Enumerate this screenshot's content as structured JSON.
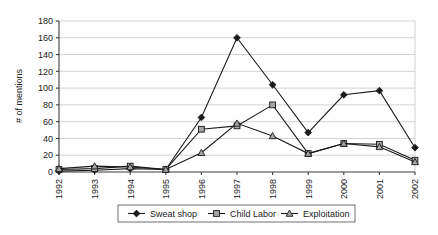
{
  "chart_data": {
    "type": "line",
    "title": "",
    "xlabel": "",
    "ylabel": "# of mentions",
    "categories": [
      "1992",
      "1993",
      "1994",
      "1995",
      "1996",
      "1997",
      "1998",
      "1999",
      "2000",
      "2001",
      "2002"
    ],
    "ylim": [
      0,
      180
    ],
    "ytick_step": 20,
    "yticks": [
      "0",
      "20",
      "40",
      "60",
      "80",
      "100",
      "120",
      "140",
      "160",
      "180"
    ],
    "grid": "horizontal",
    "legend_position": "bottom",
    "series": [
      {
        "name": "Sweat shop",
        "marker": "diamond-filled",
        "color": "#1a1a1a",
        "values": [
          1,
          2,
          4,
          3,
          65,
          160,
          104,
          47,
          92,
          97,
          29
        ]
      },
      {
        "name": "Child Labor",
        "marker": "square",
        "color": "#a6a6a6",
        "values": [
          3,
          4,
          7,
          3,
          51,
          55,
          80,
          22,
          34,
          33,
          14
        ]
      },
      {
        "name": "Exploitation",
        "marker": "triangle",
        "color": "#a6a6a6",
        "values": [
          4,
          7,
          6,
          3,
          23,
          58,
          43,
          22,
          34,
          30,
          12
        ]
      }
    ]
  },
  "legend": {
    "items": [
      {
        "label": "Sweat shop"
      },
      {
        "label": "Child Labor"
      },
      {
        "label": "Exploitation"
      }
    ]
  },
  "axes": {
    "y_axis_title": "# of mentions"
  }
}
